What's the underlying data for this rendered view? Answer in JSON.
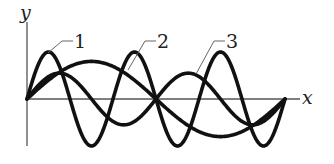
{
  "figure": {
    "axes": {
      "x_label": "x",
      "y_label": "y"
    },
    "curve_labels": [
      "1",
      "2",
      "3"
    ],
    "colors": {
      "curve": "#111111",
      "axis": "#555555",
      "background": "#ffffff"
    }
  },
  "chart_data": {
    "type": "line",
    "title": "",
    "xlabel": "x",
    "ylabel": "y",
    "grid": false,
    "note": "Three sinusoidal waves starting at the origin and ending at the same point on the x-axis; values in relative units (x domain 0..1, amplitudes relative to curve 1).",
    "series": [
      {
        "name": "1",
        "cycles": 3,
        "amplitude": 1.0,
        "phase": 0
      },
      {
        "name": "2",
        "cycles": 1,
        "amplitude": 0.8,
        "phase": 0
      },
      {
        "name": "3",
        "cycles": 2,
        "amplitude": 0.55,
        "phase": 0
      }
    ],
    "xlim": [
      0,
      1
    ],
    "ylim": [
      -1.1,
      1.1
    ]
  }
}
